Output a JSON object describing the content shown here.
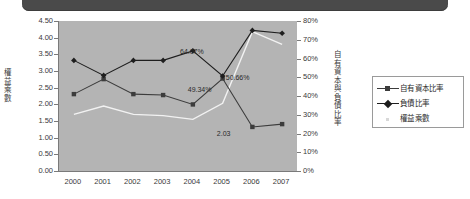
{
  "banner": {
    "label": ""
  },
  "chart_data": {
    "type": "line",
    "title": "",
    "xlabel": "",
    "categories": [
      "2000",
      "2001",
      "2002",
      "2003",
      "2004",
      "2005",
      "2006",
      "2007"
    ],
    "grid": false,
    "legend_position": "right",
    "axes": {
      "left": {
        "title": "權益乘數",
        "min": 0.0,
        "max": 4.5,
        "step": 0.5,
        "ticks": [
          "0.00",
          "0.50",
          "1.00",
          "1.50",
          "2.00",
          "2.50",
          "3.00",
          "3.50",
          "4.00",
          "4.50"
        ],
        "tick_values": [
          0.0,
          0.5,
          1.0,
          1.5,
          2.0,
          2.5,
          3.0,
          3.5,
          4.0,
          4.5
        ]
      },
      "right": {
        "title": "自有資本與負債比率",
        "min": 0,
        "max": 80,
        "step": 10,
        "ticks": [
          "0%",
          "10%",
          "20%",
          "30%",
          "40%",
          "50%",
          "60%",
          "70%",
          "80%"
        ],
        "tick_values": [
          0,
          10,
          20,
          30,
          40,
          50,
          60,
          70,
          80
        ]
      }
    },
    "series": [
      {
        "name": "自有資本比率",
        "axis": "right",
        "marker": "square",
        "color": "#3c3c3c",
        "values": [
          41.0,
          49.0,
          41.0,
          40.5,
          35.5,
          49.34,
          23.5,
          25.0
        ]
      },
      {
        "name": "負債比率",
        "axis": "right",
        "marker": "diamond",
        "color": "#1e1e1e",
        "values": [
          59.0,
          51.0,
          59.0,
          59.0,
          64.07,
          50.66,
          75.0,
          73.5
        ]
      },
      {
        "name": "權益乘數",
        "axis": "left",
        "marker": "none",
        "color": "#f2f2f2",
        "values": [
          1.7,
          1.95,
          1.7,
          1.66,
          1.55,
          2.03,
          4.18,
          3.8
        ]
      }
    ],
    "annotations": [
      {
        "text": "64.07%",
        "series": "負債比率",
        "category": "2004"
      },
      {
        "text": "49.34%",
        "series": "自有資本比率",
        "category": "2005"
      },
      {
        "text": "50.66%",
        "series": "負債比率",
        "category": "2005"
      },
      {
        "text": "2.03",
        "series": "權益乘數",
        "category": "2005"
      }
    ]
  },
  "legend": {
    "items": [
      {
        "label": "自有資本比率",
        "marker": "square",
        "color": "#3c3c3c"
      },
      {
        "label": "負債比率",
        "marker": "diamond",
        "color": "#1e1e1e"
      },
      {
        "label": "權益乘數",
        "marker": "dot",
        "color": "#d8d8d8"
      }
    ]
  }
}
